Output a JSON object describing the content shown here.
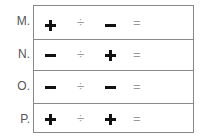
{
  "rows": [
    {
      "label": "M.",
      "first": "plus",
      "op": "÷",
      "second": "minus",
      "eq": "="
    },
    {
      "label": "N.",
      "first": "minus",
      "op": "÷",
      "second": "plus",
      "eq": "="
    },
    {
      "label": "O.",
      "first": "minus",
      "op": "÷",
      "second": "minus",
      "eq": "="
    },
    {
      "label": "P.",
      "first": "plus",
      "op": "÷",
      "second": "plus",
      "eq": "="
    }
  ]
}
